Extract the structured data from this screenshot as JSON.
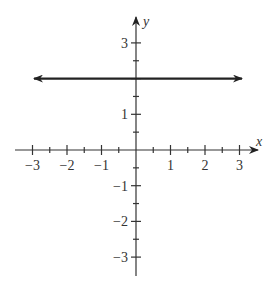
{
  "chart_data": {
    "type": "line",
    "title": "",
    "xlabel": "x",
    "ylabel": "y",
    "xlim": [
      -3.5,
      3.5
    ],
    "ylim": [
      -3.5,
      3.5
    ],
    "grid": false,
    "legend": null,
    "x_ticks": [
      -3,
      -2,
      -1,
      1,
      2,
      3
    ],
    "x_tick_labels": [
      "−3",
      "−2",
      "−1",
      "1",
      "2",
      "3"
    ],
    "y_ticks": [
      -3,
      -2,
      -1,
      1,
      3
    ],
    "y_tick_labels": [
      "−3",
      "−2",
      "−1",
      "1",
      "3"
    ],
    "minor_tick_step": 0.5,
    "series": [
      {
        "name": "y = 2",
        "equation": "y = 2",
        "x": [
          -3,
          3
        ],
        "y": [
          2,
          2
        ],
        "arrows_both_ends": true,
        "color": "#222222"
      }
    ]
  },
  "layout": {
    "origin_px": [
      136,
      150
    ],
    "unit_px_x": 34.5,
    "unit_px_y": 35.7,
    "x_axis_px": [
      15,
      258
    ],
    "y_axis_px": [
      17,
      276
    ],
    "line_px": {
      "x1": 34,
      "x2": 242
    },
    "axis_color": "#333333",
    "line_color": "#222222"
  }
}
